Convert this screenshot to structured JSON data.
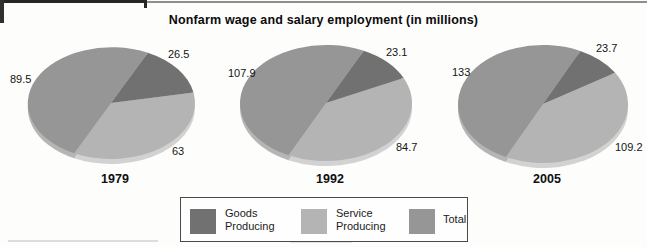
{
  "title": "Nonfarm wage and salary employment (in millions)",
  "chart_data": {
    "type": "pie",
    "title": "Nonfarm wage and salary employment (in millions)",
    "unit": "millions of jobs",
    "note": "Each pie shows Goods Producing + Service Producing = Total; Total occupies half of each pie.",
    "legend": {
      "goods": "Goods Producing",
      "service": "Service Producing",
      "total": "Total"
    },
    "colors": {
      "goods": "#717171",
      "service": "#b4b4b4",
      "total": "#969696",
      "rim_goods": "#9d9d9d",
      "rim_service": "#d2d2d2",
      "rim_total": "#b5b5b5"
    },
    "pies": [
      {
        "year": "1979",
        "values": {
          "goods": 26.5,
          "service": 63,
          "total": 89.5
        },
        "labels": {
          "goods": "26.5",
          "service": "63",
          "total": "89.5"
        }
      },
      {
        "year": "1992",
        "values": {
          "goods": 23.1,
          "service": 84.7,
          "total": 107.9
        },
        "labels": {
          "goods": "23.1",
          "service": "84.7",
          "total": "107.9"
        }
      },
      {
        "year": "2005",
        "values": {
          "goods": 23.7,
          "service": 109.2,
          "total": 133
        },
        "labels": {
          "goods": "23.7",
          "service": "109.2",
          "total": "133"
        }
      }
    ]
  }
}
